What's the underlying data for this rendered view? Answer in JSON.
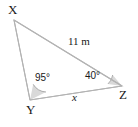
{
  "figure": {
    "type": "triangle-diagram",
    "width": 138,
    "height": 127,
    "background_color": "#ffffff",
    "stroke_color": "#b3b3b3",
    "angle_fill_color": "#d9d9d9",
    "text_color": "#1a1a1a"
  },
  "vertices": {
    "x": {
      "label": "X",
      "px": 14,
      "py": 20
    },
    "y": {
      "label": "Y",
      "px": 30,
      "py": 100
    },
    "z": {
      "label": "Z",
      "px": 122,
      "py": 86
    }
  },
  "sides": {
    "xz": {
      "label": "11 m",
      "value": "11",
      "unit": "m"
    },
    "yz": {
      "label": "x",
      "value": "x",
      "unit": ""
    },
    "xy": {
      "label": "",
      "value": "",
      "unit": ""
    }
  },
  "angles": {
    "at_y": {
      "label": "95°",
      "value": 95,
      "unit": "degrees"
    },
    "at_z": {
      "label": "40°",
      "value": 40,
      "unit": "degrees"
    },
    "at_x": {
      "label": "",
      "value": 45,
      "unit": "degrees"
    }
  }
}
